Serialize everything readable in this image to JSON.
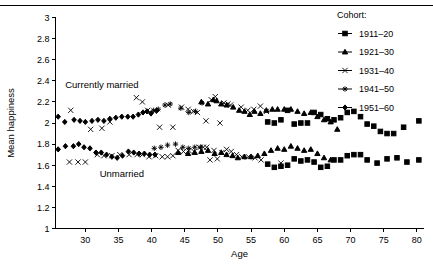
{
  "chart_data": {
    "type": "scatter",
    "title": "",
    "xlabel": "Age",
    "ylabel": "Mean happiness",
    "xlim": [
      25.5,
      81
    ],
    "ylim": [
      1,
      3
    ],
    "xticks": [
      30,
      35,
      40,
      45,
      50,
      55,
      60,
      65,
      70,
      75,
      80
    ],
    "yticks": [
      1,
      1.2,
      1.4,
      1.6,
      1.8,
      2,
      2.2,
      2.4,
      2.6,
      2.8,
      3
    ],
    "ytick_labels": [
      "1",
      "1.2",
      "1.4",
      "1.6",
      "1.8",
      "2",
      "2.2",
      "2.4",
      "2.6",
      "2.8",
      "3"
    ],
    "xtick_labels": [
      "30",
      "35",
      "40",
      "45",
      "50",
      "55",
      "60",
      "65",
      "70",
      "75",
      "80"
    ],
    "grid": false,
    "legend_position": "top-right",
    "legend_title": "Cohort:",
    "annotations": [
      {
        "text": "Currently married",
        "x": 32.5,
        "y": 2.33
      },
      {
        "text": "Unmarried",
        "x": 35.5,
        "y": 1.49
      }
    ],
    "series": [
      {
        "name": "1911–20",
        "marker": "square",
        "group": "Currently married",
        "points": [
          [
            57.5,
            2.01
          ],
          [
            58.5,
            2.0
          ],
          [
            59.5,
            2.03
          ],
          [
            60.5,
            2.12
          ],
          [
            61.5,
            1.99
          ],
          [
            62.5,
            2.0
          ],
          [
            63.5,
            2.0
          ],
          [
            64.5,
            2.1
          ],
          [
            65.5,
            2.08
          ],
          [
            66.5,
            2.04
          ],
          [
            67.5,
            2.03
          ],
          [
            68.5,
            2.05
          ],
          [
            69.5,
            2.1
          ],
          [
            70.5,
            2.11
          ],
          [
            71.5,
            2.06
          ],
          [
            72.5,
            1.99
          ],
          [
            73.5,
            1.97
          ],
          [
            74.5,
            1.92
          ],
          [
            75.5,
            1.9
          ],
          [
            76.5,
            1.9
          ],
          [
            78.0,
            1.96
          ],
          [
            80.3,
            2.02
          ]
        ]
      },
      {
        "name": "1911–20",
        "marker": "square",
        "group": "Unmarried",
        "points": [
          [
            57.5,
            1.61
          ],
          [
            58.5,
            1.58
          ],
          [
            59.5,
            1.59
          ],
          [
            60.5,
            1.6
          ],
          [
            61.5,
            1.66
          ],
          [
            62.5,
            1.64
          ],
          [
            63.5,
            1.65
          ],
          [
            64.5,
            1.63
          ],
          [
            65.5,
            1.58
          ],
          [
            66.5,
            1.59
          ],
          [
            67.5,
            1.65
          ],
          [
            68.5,
            1.65
          ],
          [
            69.5,
            1.69
          ],
          [
            70.5,
            1.7
          ],
          [
            71.5,
            1.7
          ],
          [
            72.5,
            1.65
          ],
          [
            74.0,
            1.62
          ],
          [
            75.5,
            1.66
          ],
          [
            77.0,
            1.67
          ],
          [
            78.5,
            1.63
          ],
          [
            80.3,
            1.65
          ]
        ]
      },
      {
        "name": "1921–30",
        "marker": "triangle",
        "group": "Currently married",
        "points": [
          [
            47.5,
            2.2
          ],
          [
            48.5,
            2.18
          ],
          [
            49.3,
            2.22
          ],
          [
            49.8,
            2.21
          ],
          [
            50.5,
            2.18
          ],
          [
            51.3,
            2.17
          ],
          [
            52.3,
            2.15
          ],
          [
            53.2,
            2.12
          ],
          [
            54.0,
            2.11
          ],
          [
            54.8,
            2.08
          ],
          [
            55.5,
            2.11
          ],
          [
            56.4,
            2.09
          ],
          [
            57.3,
            2.12
          ],
          [
            58.2,
            2.13
          ],
          [
            59.0,
            2.13
          ],
          [
            60.0,
            2.13
          ],
          [
            61.0,
            2.13
          ],
          [
            62.0,
            2.11
          ],
          [
            63.0,
            2.09
          ],
          [
            64.0,
            2.1
          ],
          [
            65.0,
            2.06
          ],
          [
            66.0,
            2.03
          ],
          [
            67.0,
            2.01
          ],
          [
            68.0,
            1.94
          ]
        ]
      },
      {
        "name": "1921–30",
        "marker": "triangle",
        "group": "Unmarried",
        "points": [
          [
            44.0,
            1.72
          ],
          [
            45.5,
            1.71
          ],
          [
            46.5,
            1.72
          ],
          [
            47.5,
            1.73
          ],
          [
            48.5,
            1.74
          ],
          [
            49.5,
            1.71
          ],
          [
            50.5,
            1.72
          ],
          [
            51.3,
            1.7
          ],
          [
            52.2,
            1.69
          ],
          [
            53.0,
            1.67
          ],
          [
            54.0,
            1.68
          ],
          [
            55.0,
            1.68
          ],
          [
            56.0,
            1.69
          ],
          [
            57.0,
            1.71
          ],
          [
            58.0,
            1.74
          ],
          [
            59.0,
            1.76
          ],
          [
            60.0,
            1.75
          ],
          [
            61.0,
            1.78
          ],
          [
            62.0,
            1.76
          ],
          [
            63.0,
            1.74
          ],
          [
            64.0,
            1.75
          ],
          [
            65.0,
            1.71
          ],
          [
            66.0,
            1.67
          ],
          [
            67.0,
            1.65
          ]
        ]
      },
      {
        "name": "1931–40",
        "marker": "x",
        "group": "Currently married",
        "points": [
          [
            27.8,
            2.12
          ],
          [
            30.8,
            1.94
          ],
          [
            32.5,
            1.95
          ],
          [
            33.7,
            2.01
          ],
          [
            37.7,
            2.24
          ],
          [
            38.6,
            2.2
          ],
          [
            39.4,
            2.12
          ],
          [
            40.4,
            2.11
          ],
          [
            41.2,
            1.96
          ],
          [
            42.5,
            2.17
          ],
          [
            43.2,
            1.96
          ],
          [
            44.5,
            2.15
          ],
          [
            45.5,
            2.13
          ],
          [
            46.3,
            2.11
          ],
          [
            46.9,
            2.1
          ],
          [
            48.2,
            2.02
          ],
          [
            49.0,
            2.22
          ],
          [
            49.6,
            2.25
          ],
          [
            50.3,
            2.0
          ],
          [
            50.9,
            2.19
          ],
          [
            51.5,
            2.18
          ],
          [
            51.9,
            2.17
          ],
          [
            53.5,
            2.15
          ],
          [
            54.5,
            2.12
          ],
          [
            55.4,
            2.13
          ],
          [
            56.4,
            2.16
          ],
          [
            57.3,
            2.11
          ]
        ]
      },
      {
        "name": "1931–40",
        "marker": "x",
        "group": "Unmarried",
        "points": [
          [
            27.6,
            1.63
          ],
          [
            28.9,
            1.63
          ],
          [
            30.0,
            1.63
          ],
          [
            31.8,
            1.7
          ],
          [
            32.8,
            1.69
          ],
          [
            34.0,
            1.69
          ],
          [
            35.2,
            1.7
          ],
          [
            36.6,
            1.7
          ],
          [
            37.8,
            1.7
          ],
          [
            38.6,
            1.7
          ],
          [
            39.6,
            1.68
          ],
          [
            40.6,
            1.69
          ],
          [
            41.6,
            1.68
          ],
          [
            42.4,
            1.68
          ],
          [
            43.2,
            1.69
          ],
          [
            44.0,
            1.74
          ],
          [
            44.8,
            1.73
          ],
          [
            45.6,
            1.74
          ],
          [
            46.4,
            1.73
          ],
          [
            47.2,
            1.77
          ],
          [
            47.8,
            1.77
          ],
          [
            48.3,
            1.77
          ],
          [
            48.8,
            1.65
          ],
          [
            49.4,
            1.74
          ],
          [
            49.9,
            1.66
          ],
          [
            50.6,
            1.72
          ],
          [
            51.3,
            1.75
          ],
          [
            52.0,
            1.73
          ],
          [
            52.8,
            1.7
          ],
          [
            53.6,
            1.68
          ],
          [
            54.6,
            1.68
          ],
          [
            55.6,
            1.67
          ],
          [
            56.5,
            1.65
          ],
          [
            59.5,
            1.62
          ]
        ]
      },
      {
        "name": "1941–50",
        "marker": "star",
        "group": "Currently married",
        "points": [
          [
            40.3,
            2.12
          ],
          [
            41.0,
            2.13
          ],
          [
            42.0,
            2.17
          ],
          [
            42.8,
            2.18
          ],
          [
            44.4,
            2.14
          ],
          [
            45.6,
            2.1
          ],
          [
            46.6,
            2.11
          ],
          [
            47.6,
            2.19
          ]
        ]
      },
      {
        "name": "1941–50",
        "marker": "star",
        "group": "Unmarried",
        "points": [
          [
            40.4,
            1.76
          ],
          [
            41.4,
            1.77
          ],
          [
            42.4,
            1.79
          ],
          [
            43.6,
            1.8
          ],
          [
            44.7,
            1.77
          ],
          [
            45.6,
            1.76
          ],
          [
            46.5,
            1.77
          ],
          [
            47.4,
            1.77
          ]
        ]
      },
      {
        "name": "1951–60",
        "marker": "diamond",
        "group": "Currently married",
        "points": [
          [
            25.9,
            2.06
          ],
          [
            26.9,
            2.01
          ],
          [
            28.3,
            2.03
          ],
          [
            29.2,
            2.02
          ],
          [
            30.0,
            2.01
          ],
          [
            31.0,
            2.02
          ],
          [
            31.9,
            2.03
          ],
          [
            32.8,
            2.02
          ],
          [
            33.7,
            2.04
          ],
          [
            34.6,
            2.05
          ],
          [
            35.5,
            2.06
          ],
          [
            36.4,
            2.06
          ],
          [
            37.2,
            2.06
          ],
          [
            38.0,
            2.08
          ],
          [
            38.7,
            2.1
          ],
          [
            39.3,
            2.11
          ],
          [
            39.9,
            2.09
          ],
          [
            40.8,
            2.12
          ]
        ]
      },
      {
        "name": "1951–60",
        "marker": "diamond",
        "group": "Unmarried",
        "points": [
          [
            25.9,
            1.75
          ],
          [
            27.0,
            1.78
          ],
          [
            28.2,
            1.78
          ],
          [
            29.0,
            1.8
          ],
          [
            29.8,
            1.77
          ],
          [
            30.7,
            1.76
          ],
          [
            31.6,
            1.72
          ],
          [
            32.4,
            1.72
          ],
          [
            33.2,
            1.7
          ],
          [
            34.0,
            1.68
          ],
          [
            34.8,
            1.67
          ],
          [
            35.6,
            1.69
          ],
          [
            36.5,
            1.73
          ],
          [
            37.3,
            1.72
          ],
          [
            38.1,
            1.71
          ],
          [
            38.9,
            1.71
          ],
          [
            39.7,
            1.7
          ],
          [
            40.5,
            1.7
          ]
        ]
      }
    ],
    "legend_entries": [
      {
        "label": "1911–20",
        "marker": "square"
      },
      {
        "label": "1921–30",
        "marker": "triangle"
      },
      {
        "label": "1931–40",
        "marker": "x"
      },
      {
        "label": "1941–50",
        "marker": "star"
      },
      {
        "label": "1951–60",
        "marker": "diamond"
      }
    ]
  }
}
